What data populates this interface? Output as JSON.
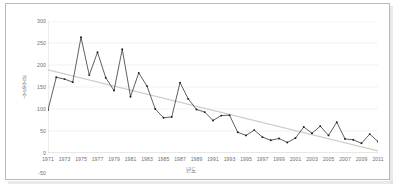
{
  "figure": {
    "frame_border_color": "#b9b9b9",
    "background": "#ffffff",
    "caption": ""
  },
  "axis_titles": {
    "x": "년도",
    "y": "강수일수"
  },
  "colors": {
    "series_line": "#2b2b2b",
    "marker": "#1a1a1a",
    "trendline": "#d2cdc4",
    "gridline": "#eceaea",
    "axis": "#c8c8c8",
    "tick_text": "#6e6e6e"
  },
  "chart_data": {
    "type": "line",
    "title": "",
    "subtitle": "",
    "xlabel": "년도",
    "ylabel": "강수일수",
    "xlim": [
      1971,
      2011
    ],
    "ylim": [
      0,
      300
    ],
    "ytick_values": [
      300,
      250,
      200,
      150,
      100,
      50,
      0
    ],
    "ytick_labels": [
      "300",
      "250",
      "200",
      "150",
      "100",
      "50",
      "0"
    ],
    "extra_ytick_label": "-50",
    "xtick_labels": [
      "1971",
      "1973",
      "1975",
      "1977",
      "1979",
      "1981",
      "1983",
      "1985",
      "1987",
      "1989",
      "1991",
      "1993",
      "1995",
      "1997",
      "1999",
      "2001",
      "2003",
      "2005",
      "2007",
      "2009",
      "2011"
    ],
    "grid": {
      "horizontal": true,
      "vertical": false
    },
    "legend": {
      "show": false,
      "position": "none"
    },
    "markers": true,
    "x": [
      1971,
      1972,
      1973,
      1974,
      1975,
      1976,
      1977,
      1978,
      1979,
      1980,
      1981,
      1982,
      1983,
      1984,
      1985,
      1986,
      1987,
      1988,
      1989,
      1990,
      1991,
      1992,
      1993,
      1994,
      1995,
      1996,
      1997,
      1998,
      1999,
      2000,
      2001,
      2002,
      2003,
      2004,
      2005,
      2006,
      2007,
      2008,
      2009,
      2010,
      2011
    ],
    "series": [
      {
        "name": "강수일수",
        "values": [
          98,
          172,
          168,
          161,
          263,
          177,
          229,
          171,
          142,
          236,
          128,
          182,
          152,
          100,
          80,
          82,
          160,
          123,
          99,
          93,
          74,
          85,
          86,
          47,
          40,
          52,
          36,
          29,
          33,
          24,
          34,
          59,
          45,
          61,
          40,
          70,
          32,
          30,
          22,
          43,
          26
        ]
      },
      {
        "name": "추세선",
        "type": "trend",
        "endpoints": {
          "x": [
            1971,
            2011
          ],
          "y": [
            189,
            5
          ]
        }
      }
    ]
  }
}
